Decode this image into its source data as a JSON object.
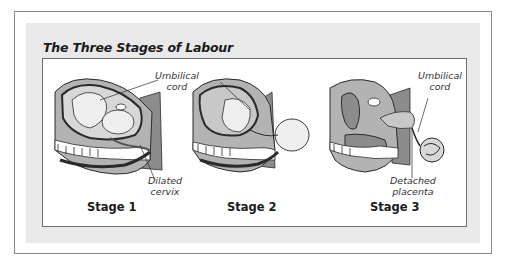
{
  "figure": {
    "title": "The Three Stages of Labour",
    "stages": [
      {
        "label": "Stage 1",
        "annotations": [
          "Umbilical cord",
          "Dilated cervix"
        ]
      },
      {
        "label": "Stage 2",
        "annotations": []
      },
      {
        "label": "Stage 3",
        "annotations": [
          "Umbilical cord",
          "Detached placenta"
        ]
      }
    ],
    "annotations": {
      "stage1_cord_line1": "Umbilical",
      "stage1_cord_line2": "cord",
      "stage1_cervix_line1": "Dilated",
      "stage1_cervix_line2": "cervix",
      "stage3_cord_line1": "Umbilical",
      "stage3_cord_line2": "cord",
      "stage3_placenta_line1": "Detached",
      "stage3_placenta_line2": "placenta"
    },
    "stage_labels": {
      "s1": "Stage 1",
      "s2": "Stage 2",
      "s3": "Stage 3"
    },
    "colors": {
      "dark_gray": "#8c8c8c",
      "mid_gray": "#b3b3b3",
      "light_gray": "#d8d8d8",
      "outline": "#2a2a2a",
      "panel_bg": "#e9e9e9"
    }
  }
}
